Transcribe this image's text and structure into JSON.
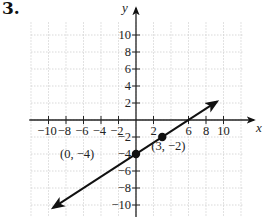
{
  "problem_number": "3.",
  "chart_data": {
    "type": "line",
    "title": "",
    "xlabel": "x",
    "ylabel": "y",
    "xlim": [
      -12,
      12
    ],
    "ylim": [
      -12,
      12
    ],
    "grid": true,
    "x_ticks": [
      -10,
      -8,
      -6,
      -4,
      -2,
      2,
      6,
      8,
      10
    ],
    "x_tick_labels": [
      "−10",
      "−8",
      "−6",
      "−4",
      "−2",
      "2",
      "6",
      "8",
      "10"
    ],
    "y_ticks": [
      10,
      8,
      6,
      4,
      2,
      -2,
      -4,
      -6,
      -8,
      -10
    ],
    "y_tick_labels": [
      "10",
      "8",
      "6",
      "4",
      "2",
      "−2",
      "−4",
      "−6",
      "−8",
      "−10"
    ],
    "series": [
      {
        "name": "line",
        "equation": "y = (2/3)x - 4",
        "slope": 0.6667,
        "intercept": -4,
        "x": [
          -9,
          9
        ],
        "y": [
          -10,
          2
        ],
        "arrows": "both"
      }
    ],
    "points": [
      {
        "x": 0,
        "y": -4,
        "label": "(0, −4)"
      },
      {
        "x": 3,
        "y": -2,
        "label": "(3, −2)"
      }
    ]
  },
  "colors": {
    "axis": "#222222",
    "line": "#111111",
    "grid": "#cfcfcf"
  }
}
